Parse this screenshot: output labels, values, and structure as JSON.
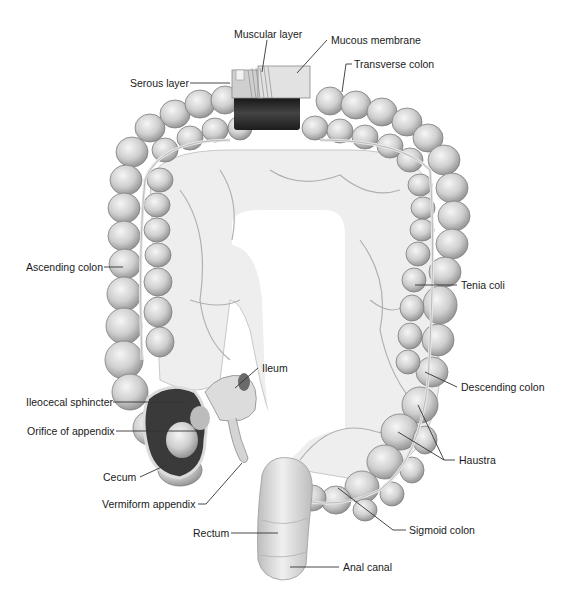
{
  "figure": {
    "colors": {
      "tissue": "#d9d9d9",
      "tissue_shadow": "#9a9a9a",
      "tissue_highlight": "#f4f4f4",
      "mesentery": "#ececec",
      "vessel": "#b5b5b5",
      "dark_band": "#2e2e2e",
      "leader_line": "#333333",
      "text": "#1a1a1a"
    },
    "labels": [
      {
        "id": "muscular-layer",
        "text": "Muscular layer",
        "x": 234,
        "y": 28
      },
      {
        "id": "mucous-membrane",
        "text": "Mucous membrane",
        "x": 331,
        "y": 36
      },
      {
        "id": "serous-layer",
        "text": "Serous layer",
        "x": 130,
        "y": 58
      },
      {
        "id": "transverse-colon",
        "text": "Transverse colon",
        "x": 354,
        "y": 60
      },
      {
        "id": "ascending-colon",
        "text": "Ascending colon",
        "x": 26,
        "y": 260
      },
      {
        "id": "tenia-coli",
        "text": "Tenia coli",
        "x": 461,
        "y": 280
      },
      {
        "id": "ileum",
        "text": "Ileum",
        "x": 262,
        "y": 363
      },
      {
        "id": "descending-colon",
        "text": "Descending colon",
        "x": 461,
        "y": 382
      },
      {
        "id": "ileocecal-sphincter",
        "text": "Ileocecal sphincter",
        "x": 26,
        "y": 397
      },
      {
        "id": "orifice-of-appendix",
        "text": "Orifice of appendix",
        "x": 27,
        "y": 426
      },
      {
        "id": "haustra",
        "text": "Haustra",
        "x": 459,
        "y": 455
      },
      {
        "id": "cecum",
        "text": "Cecum",
        "x": 103,
        "y": 472
      },
      {
        "id": "vermiform-appendix",
        "text": "Vermiform appendix",
        "x": 102,
        "y": 499
      },
      {
        "id": "sigmoid-colon",
        "text": "Sigmoid colon",
        "x": 409,
        "y": 525
      },
      {
        "id": "rectum",
        "text": "Rectum",
        "x": 193,
        "y": 528
      },
      {
        "id": "anal-canal",
        "text": "Anal canal",
        "x": 343,
        "y": 562
      }
    ]
  }
}
